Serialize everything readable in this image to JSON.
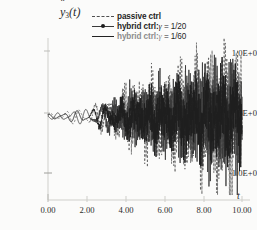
{
  "figure": {
    "background": "#fbfbfa",
    "ink": "#2a2a2a"
  },
  "axes": {
    "y_axis_label": "y",
    "y_axis_subscript": "3",
    "y_axis_arg": "(t)",
    "x_axis_label": "t",
    "y_ticks": [
      "1.0E+0",
      "0.0E+0",
      "-1.0E+0"
    ],
    "x_ticks": [
      "0.00",
      "2.00",
      "4.00",
      "6.00",
      "8.00",
      "10.00"
    ]
  },
  "legend": {
    "items": [
      {
        "key": "dashed",
        "label": "passive ctrl",
        "gamma": "",
        "value": ""
      },
      {
        "key": "dash-dot-marker",
        "label": "hybrid ctrl:",
        "gamma": "γ",
        "value": " = 1/20"
      },
      {
        "key": "solid",
        "label": "hybrid ctrl:",
        "gamma": "γ",
        "value": " = 1/60"
      }
    ]
  },
  "chart_data": {
    "type": "line",
    "title": "",
    "subtitle": "",
    "xlabel": "t",
    "ylabel": "ÿ3(t)",
    "xlim": [
      0.0,
      10.0
    ],
    "ylim": [
      -1.6,
      1.6
    ],
    "xticks": [
      0.0,
      2.0,
      4.0,
      6.0,
      8.0,
      10.0
    ],
    "yticks": [
      -1.0,
      0.0,
      1.0
    ],
    "grid": false,
    "legend_position": "top-right",
    "x_tick_format": "0.00",
    "y_tick_format": "0.0E+0",
    "series": [
      {
        "name": "passive ctrl",
        "style": "dashed",
        "color": "#555555",
        "envelope_x": [
          0.0,
          1.0,
          2.0,
          3.0,
          4.0,
          5.0,
          6.0,
          7.0,
          8.0,
          9.0,
          10.0
        ],
        "envelope_y": [
          0.06,
          0.14,
          0.22,
          0.42,
          0.62,
          0.74,
          0.92,
          1.05,
          1.25,
          1.48,
          1.3
        ]
      },
      {
        "name": "hybrid ctrl: gamma = 1/20",
        "style": "dash-dot-marker",
        "color": "#333333",
        "envelope_x": [
          0.0,
          1.0,
          2.0,
          3.0,
          4.0,
          5.0,
          6.0,
          7.0,
          8.0,
          9.0,
          10.0
        ],
        "envelope_y": [
          0.05,
          0.12,
          0.19,
          0.34,
          0.5,
          0.6,
          0.74,
          0.84,
          1.0,
          1.15,
          1.02
        ]
      },
      {
        "name": "hybrid ctrl: gamma = 1/60",
        "style": "solid",
        "color": "#1f1f1f",
        "envelope_x": [
          0.0,
          1.0,
          2.0,
          3.0,
          4.0,
          5.0,
          6.0,
          7.0,
          8.0,
          9.0,
          10.0
        ],
        "envelope_y": [
          0.05,
          0.11,
          0.17,
          0.3,
          0.44,
          0.53,
          0.66,
          0.75,
          0.88,
          1.0,
          0.9
        ]
      }
    ]
  }
}
